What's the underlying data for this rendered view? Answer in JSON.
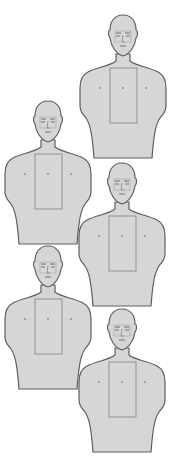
{
  "page": {
    "background": "#ffffff"
  },
  "style": {
    "fill": "#d6d6d6",
    "outline": "#5e5e5e",
    "zone_outline": "#8c8c8c",
    "face_lines": "#6a6a6a"
  },
  "targets": [
    {
      "id": "target-1",
      "column": "right",
      "x": 80,
      "y": 16,
      "scale": 1.0
    },
    {
      "id": "target-2",
      "column": "left",
      "x": 5,
      "y": 100,
      "scale": 1.0
    },
    {
      "id": "target-3",
      "column": "right",
      "x": 80,
      "y": 163,
      "scale": 1.0
    },
    {
      "id": "target-4",
      "column": "left",
      "x": 5,
      "y": 246,
      "scale": 1.0
    },
    {
      "id": "target-5",
      "column": "right",
      "x": 80,
      "y": 309,
      "scale": 1.0
    }
  ],
  "target_parts": {
    "head": "head",
    "torso": "torso",
    "scoring_zone": "center-mass rectangle",
    "aim_marks": [
      "left dot",
      "center dot",
      "right dot"
    ]
  }
}
